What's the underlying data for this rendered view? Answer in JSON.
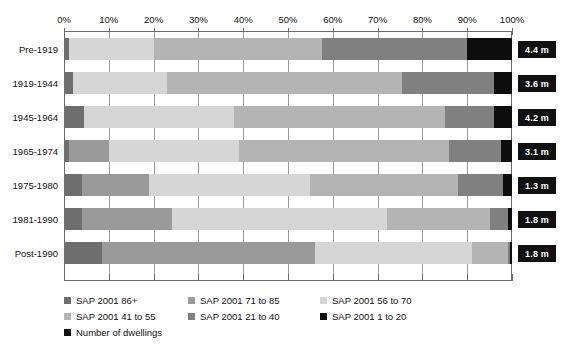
{
  "chart_data": {
    "type": "bar",
    "orientation": "horizontal",
    "stacked": true,
    "normalized_percent": true,
    "title": "",
    "subtitle": "",
    "xlabel": "",
    "ylabel": "",
    "xlim": [
      0,
      100
    ],
    "grid": true,
    "legend_position": "bottom",
    "xticklabels": [
      "0%",
      "10%",
      "20%",
      "30%",
      "40%",
      "50%",
      "60%",
      "70%",
      "80%",
      "90%",
      "100%"
    ],
    "xticks": [
      0,
      10,
      20,
      30,
      40,
      50,
      60,
      70,
      80,
      90,
      100
    ],
    "categories": [
      "Pre-1919",
      "1919-1944",
      "1945-1964",
      "1965-1974",
      "1975-1980",
      "1981-1990",
      "Post-1990"
    ],
    "series": [
      {
        "name": "SAP 2001 86+",
        "color": "#6e6e6e",
        "values": [
          1.2,
          2.0,
          4.5,
          1.2,
          4.0,
          4.0,
          8.5
        ]
      },
      {
        "name": "SAP 2001 71 to 85",
        "color": "#9a9a9a",
        "values": [
          0.0,
          0.0,
          0.0,
          8.8,
          15.0,
          20.0,
          47.5
        ]
      },
      {
        "name": "SAP 2001 56 to 70",
        "color": "#d6d6d6",
        "values": [
          18.8,
          21.0,
          33.5,
          29.0,
          36.0,
          48.0,
          35.0
        ]
      },
      {
        "name": "SAP 2001 41 to 55",
        "color": "#b4b4b4",
        "values": [
          37.5,
          52.5,
          47.0,
          47.0,
          33.0,
          23.0,
          8.0
        ]
      },
      {
        "name": "SAP 2001 21 to 40",
        "color": "#808080",
        "values": [
          32.5,
          20.5,
          11.0,
          11.5,
          10.0,
          4.0,
          0.5
        ]
      },
      {
        "name": "SAP 2001 1 to 20",
        "color": "#0d0d0d",
        "values": [
          10.0,
          4.0,
          4.0,
          2.5,
          2.0,
          1.0,
          0.5
        ]
      }
    ],
    "value_labels": {
      "series_name": "Number of dwellings",
      "color": "#111111",
      "values": [
        "4.4 m",
        "3.6 m",
        "4.2 m",
        "3.1 m",
        "1.3 m",
        "1.8 m",
        "1.8 m"
      ]
    }
  },
  "legend": {
    "entries": [
      {
        "label": "SAP 2001 86+",
        "color": "#6e6e6e"
      },
      {
        "label": "SAP 2001 71 to 85",
        "color": "#9a9a9a"
      },
      {
        "label": "SAP 2001 56 to 70",
        "color": "#d6d6d6"
      },
      {
        "label": "SAP 2001 41 to 55",
        "color": "#b4b4b4"
      },
      {
        "label": "SAP 2001 21 to 40",
        "color": "#808080"
      },
      {
        "label": "SAP 2001 1 to 20",
        "color": "#0d0d0d"
      },
      {
        "label": "Number of dwellings",
        "color": "#111111"
      }
    ]
  }
}
